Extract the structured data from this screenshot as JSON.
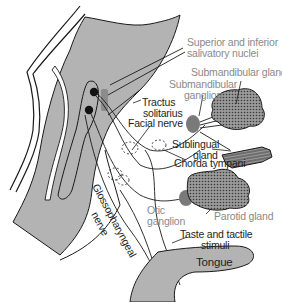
{
  "diagram": {
    "type": "anatomical-nerve-pathway",
    "colors": {
      "background": "#ffffff",
      "tissue_gray": "#b3b3b3",
      "ganglion_gray": "#7a7a7a",
      "nucleus_black": "#111111",
      "nucleus_bar_gray": "#8c8c8c",
      "gland_fill": "#8f8f8f",
      "stroke": "#1a1a1a",
      "label_gray": "#8a8a8a",
      "label_dark": "#1e1e1e"
    },
    "labels": {
      "salivatory_nuclei_line1": "Superior and inferior",
      "salivatory_nuclei_line2": "salivatory nuclei",
      "submandibular_gland": "Submandibular gland",
      "submandibular_ganglion_line1": "Submandibular",
      "submandibular_ganglion_line2": "ganglion",
      "tractus_line1": "Tractus",
      "tractus_line2": "solitarius",
      "facial_nerve": "Facial nerve",
      "sublingual_line1": "Sublingual",
      "sublingual_line2": "gland",
      "chorda_tympani": "Chorda tympani",
      "otic_ganglion_line1": "Otic",
      "otic_ganglion_line2": "ganglion",
      "parotid_gland": "Parotid gland",
      "glossopharyngeal_line1": "Glossopharyngeal",
      "glossopharyngeal_line2": "nerve",
      "taste_line1": "Taste and tactile",
      "taste_line2": "stimuli",
      "tongue": "Tongue"
    }
  }
}
